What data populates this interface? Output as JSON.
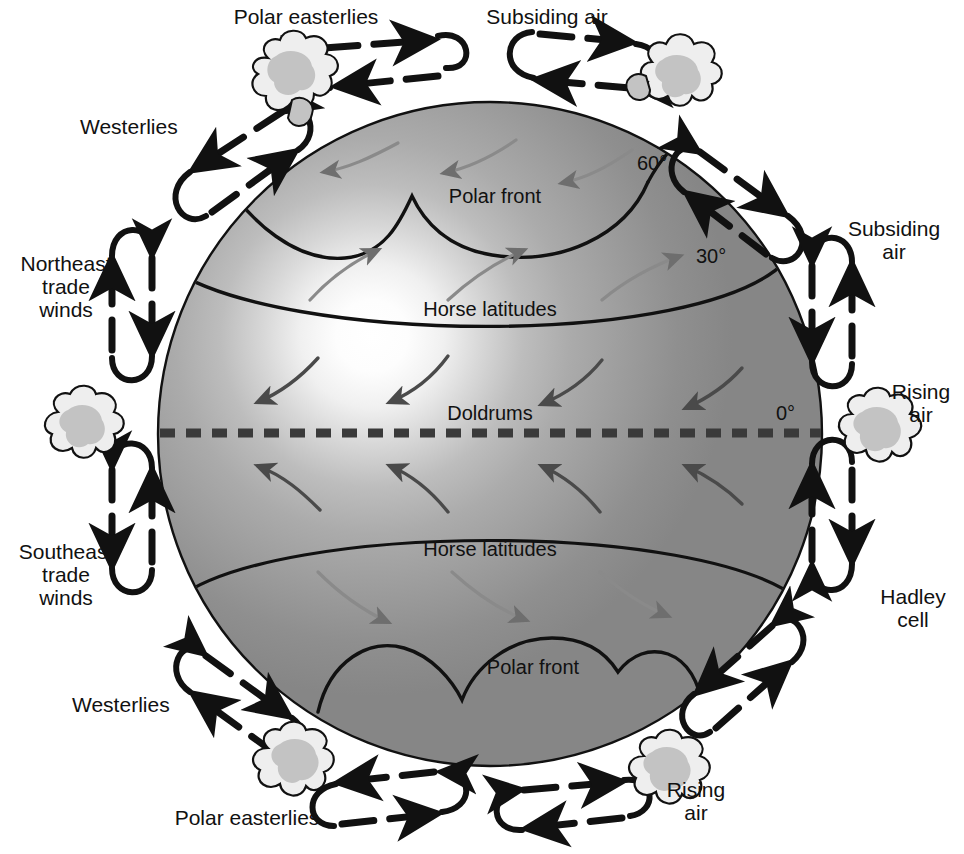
{
  "diagram": {
    "type": "global-wind-circulation-diagram"
  },
  "colors": {
    "globe_dark": "#8d8d8d",
    "globe_mid": "#a6a6a6",
    "globe_highlight": "#ffffff",
    "line": "#111111",
    "cloud_fill": "#c9c9c9",
    "cloud_light": "#eeeeee",
    "surface_arrow": "#6e6e6e",
    "background": "#ffffff"
  },
  "globe": {
    "center_x": 490,
    "center_y": 434,
    "radius": 332,
    "highlight_x": 372,
    "highlight_y": 336
  },
  "latitude_labels": [
    {
      "id": "lat-60-north",
      "text": "60°",
      "x": 655,
      "y": 163
    },
    {
      "id": "lat-30-north",
      "text": "30°",
      "x": 714,
      "y": 256
    },
    {
      "id": "lat-0-equator",
      "text": "0°",
      "x": 790,
      "y": 413
    }
  ],
  "globe_labels": [
    {
      "id": "polar-front-north",
      "text": "Polar front",
      "x": 495,
      "y": 195
    },
    {
      "id": "horse-latitudes-north",
      "text": "Horse latitudes",
      "x": 490,
      "y": 308
    },
    {
      "id": "doldrums",
      "text": "Doldrums",
      "x": 490,
      "y": 412
    },
    {
      "id": "horse-latitudes-south",
      "text": "Horse latitudes",
      "x": 490,
      "y": 548
    },
    {
      "id": "polar-front-south",
      "text": "Polar front",
      "x": 533,
      "y": 666
    }
  ],
  "outer_labels": [
    {
      "id": "polar-easterlies-north",
      "text": "Polar easterlies",
      "x": 216,
      "y": 5,
      "w": 180,
      "align": "center"
    },
    {
      "id": "subsiding-air-top",
      "text": "Subsiding air",
      "x": 452,
      "y": 5,
      "w": 190,
      "align": "center"
    },
    {
      "id": "westerlies-north",
      "text": "Westerlies",
      "x": 80,
      "y": 115,
      "w": 140,
      "align": "left"
    },
    {
      "id": "subsiding-air-right",
      "text": "Subsiding\nair",
      "x": 828,
      "y": 217,
      "w": 132,
      "align": "center"
    },
    {
      "id": "northeast-trade-winds",
      "text": "Northeast\ntrade\nwinds",
      "x": 8,
      "y": 252,
      "w": 118,
      "align": "center"
    },
    {
      "id": "rising-air-right",
      "text": "Rising\nair",
      "x": 880,
      "y": 380,
      "w": 84,
      "align": "center"
    },
    {
      "id": "southeast-trade-winds",
      "text": "Southeast\ntrade\nwinds",
      "x": 4,
      "y": 540,
      "w": 126,
      "align": "center"
    },
    {
      "id": "hadley-cell",
      "text": "Hadley\ncell",
      "x": 868,
      "y": 585,
      "w": 92,
      "align": "center"
    },
    {
      "id": "westerlies-south",
      "text": "Westerlies",
      "x": 72,
      "y": 693,
      "w": 140,
      "align": "left"
    },
    {
      "id": "polar-easterlies-south",
      "text": "Polar easterlies",
      "x": 152,
      "y": 806,
      "w": 190,
      "align": "center"
    },
    {
      "id": "rising-air-bottom",
      "text": "Rising\nair",
      "x": 654,
      "y": 778,
      "w": 86,
      "align": "center"
    }
  ],
  "circulation_cells": [
    {
      "id": "cell-polar-north-left",
      "name": "polar cell north-west"
    },
    {
      "id": "cell-ferrel-north-left",
      "name": "ferrel cell north-west"
    },
    {
      "id": "cell-hadley-north-left",
      "name": "hadley cell north-west"
    },
    {
      "id": "cell-hadley-south-left",
      "name": "hadley cell south-west"
    },
    {
      "id": "cell-ferrel-south-left",
      "name": "ferrel cell south-west"
    },
    {
      "id": "cell-polar-south-left",
      "name": "polar cell south-west"
    },
    {
      "id": "cell-polar-north-right",
      "name": "polar cell north-east"
    },
    {
      "id": "cell-ferrel-north-right",
      "name": "ferrel cell north-east"
    },
    {
      "id": "cell-hadley-north-right",
      "name": "hadley cell north-east"
    },
    {
      "id": "cell-hadley-south-right",
      "name": "hadley cell south-east"
    },
    {
      "id": "cell-ferrel-south-right",
      "name": "ferrel cell south-east"
    },
    {
      "id": "cell-polar-south-right",
      "name": "polar cell south-east"
    }
  ],
  "cloud_clusters": [
    {
      "id": "cloud-north-polar-front",
      "x": 290,
      "y": 85
    },
    {
      "id": "cloud-north-polar-front-east",
      "x": 680,
      "y": 85
    },
    {
      "id": "cloud-equator-west",
      "x": 90,
      "y": 432
    },
    {
      "id": "cloud-equator-east",
      "x": 880,
      "y": 432
    },
    {
      "id": "cloud-south-polar-front-west",
      "x": 296,
      "y": 772
    },
    {
      "id": "cloud-south-polar-front-east",
      "x": 672,
      "y": 780
    }
  ]
}
